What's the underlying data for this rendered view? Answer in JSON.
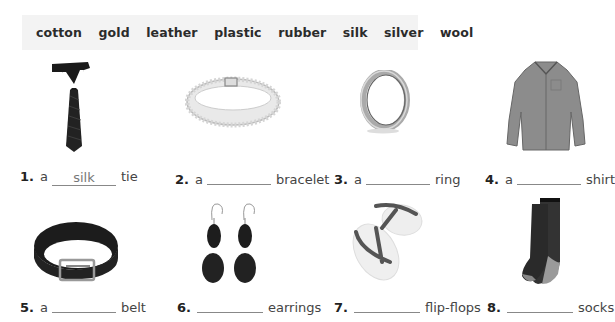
{
  "word_bank": [
    "cotton",
    "gold",
    "leather",
    "plastic",
    "rubber",
    "silk",
    "silver",
    "wool"
  ],
  "items": [
    {
      "number": "1.",
      "article": "a",
      "answer": "silk",
      "noun": "tie",
      "image": "tie-icon"
    },
    {
      "number": "2.",
      "article": "a",
      "answer": "",
      "noun": "bracelet",
      "image": "bracelet-icon"
    },
    {
      "number": "3.",
      "article": "a",
      "answer": "",
      "noun": "ring",
      "image": "ring-icon"
    },
    {
      "number": "4.",
      "article": "a",
      "answer": "",
      "noun": "shirt",
      "image": "shirt-icon"
    },
    {
      "number": "5.",
      "article": "a",
      "answer": "",
      "noun": "belt",
      "image": "belt-icon"
    },
    {
      "number": "6.",
      "article": "",
      "answer": "",
      "noun": "earrings",
      "image": "earrings-icon"
    },
    {
      "number": "7.",
      "article": "",
      "answer": "",
      "noun": "flip-flops",
      "image": "flip-flops-icon"
    },
    {
      "number": "8.",
      "article": "",
      "answer": "",
      "noun": "socks",
      "image": "socks-icon"
    }
  ]
}
